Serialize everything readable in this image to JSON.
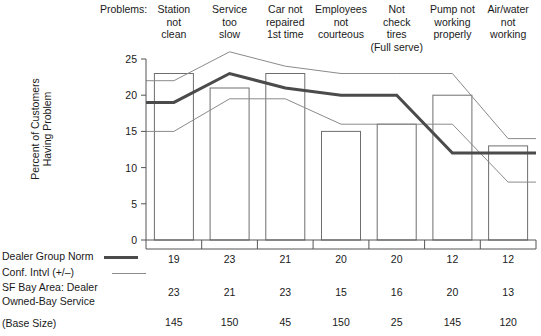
{
  "header": {
    "problems_label": "Problems:",
    "columns": [
      {
        "lines": [
          "Station",
          "not",
          "clean"
        ]
      },
      {
        "lines": [
          "Service",
          "too",
          "slow"
        ]
      },
      {
        "lines": [
          "Car not",
          "repaired",
          "1st time"
        ]
      },
      {
        "lines": [
          "Employees",
          "not",
          "courteous"
        ]
      },
      {
        "lines": [
          "Not",
          "check",
          "tires",
          "(Full serve)"
        ]
      },
      {
        "lines": [
          "Pump not",
          "working",
          "properly"
        ]
      },
      {
        "lines": [
          "Air/water",
          "not",
          "working"
        ]
      }
    ]
  },
  "legend": {
    "norm_label": "Dealer Group Norm",
    "ci_label": "Conf. Intvl (+/–)",
    "sf_label_line1": "SF Bay Area: Dealer",
    "sf_label_line2": "Owned-Bay Service",
    "base_label": "(Base Size)",
    "norm_color": "#4b4b4b",
    "ci_color": "#8a8a8a",
    "bar_color": "#6e6e6e"
  },
  "axis": {
    "title_line1": "Percent of Customers",
    "title_line2": "Having Problem",
    "ticks": [
      "0",
      "5",
      "10",
      "15",
      "20",
      "25"
    ]
  },
  "chart_data": {
    "type": "line",
    "title": "",
    "xlabel": "",
    "ylabel": "Percent of Customers Having Problem",
    "ylim": [
      0,
      25
    ],
    "grid": false,
    "legend_position": "bottom-left",
    "categories": [
      "Station not clean",
      "Service too slow",
      "Car not repaired 1st time",
      "Employees not courteous",
      "Not check tires (Full serve)",
      "Pump not working properly",
      "Air/water not working"
    ],
    "series": [
      {
        "name": "Dealer Group Norm",
        "values": [
          19,
          23,
          21,
          20,
          20,
          12,
          12
        ]
      },
      {
        "name": "Conf. Intvl upper",
        "values": [
          22,
          26,
          24,
          23,
          23,
          23,
          14
        ]
      },
      {
        "name": "Conf. Intvl lower",
        "values": [
          15,
          19.5,
          19.5,
          16,
          16,
          16,
          8
        ]
      },
      {
        "name": "SF Bay Area: Dealer Owned-Bay Service",
        "values": [
          23,
          21,
          23,
          15,
          16,
          20,
          13
        ]
      }
    ],
    "base_sizes": [
      145,
      150,
      45,
      150,
      25,
      145,
      120
    ],
    "table_rows": [
      {
        "label": "Dealer Group Norm",
        "values": [
          "19",
          "23",
          "21",
          "20",
          "20",
          "12",
          "12"
        ]
      },
      {
        "label": "SF Bay Area: Dealer Owned-Bay Service",
        "values": [
          "23",
          "21",
          "23",
          "15",
          "16",
          "20",
          "13"
        ]
      },
      {
        "label": "(Base Size)",
        "values": [
          "145",
          "150",
          "45",
          "150",
          "25",
          "145",
          "120"
        ]
      }
    ]
  }
}
